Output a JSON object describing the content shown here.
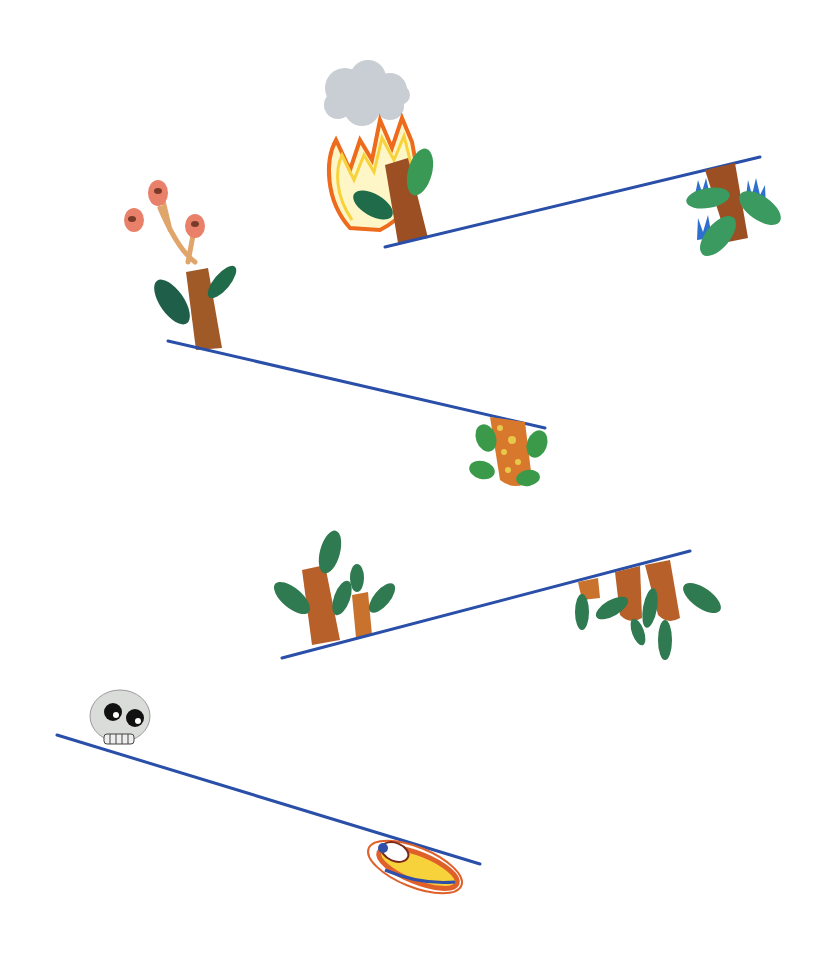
{
  "image": {
    "kind": "illustration",
    "description": "Four slanted blue ground lines; plants grow above and hang below each line; a burning tree with smoke cloud, a bud tree, a spotted cactus, small trees, a skull and a striped seed/cocoon.",
    "background": "#ffffff"
  },
  "colors": {
    "line": "#2a4fa8",
    "trunk": "#9c4f22",
    "trunk_light": "#c8722e",
    "leaf_dark": "#1f6b4a",
    "leaf": "#2f8a55",
    "leaf_light": "#4da86a",
    "flame_outer": "#ee6a1c",
    "flame_inner": "#f8d23a",
    "smoke": "#c7ccd2",
    "bud": "#e9806a",
    "bud_center": "#7a3a2a",
    "spot": "#e8c84a",
    "blue_flame": "#2f6fd0",
    "skull": "#d9dcd8",
    "eye": "#111111"
  },
  "scenes": [
    {
      "id": "line-1",
      "line": [
        385,
        247,
        760,
        157
      ],
      "above": "burning tree with smoke cloud",
      "below": "tree with blue flames"
    },
    {
      "id": "line-2",
      "line": [
        168,
        341,
        545,
        428
      ],
      "above": "tree with three buds",
      "below": "spotted cactus"
    },
    {
      "id": "line-3",
      "line": [
        282,
        658,
        690,
        551
      ],
      "above": "two small trees",
      "below": "hanging trunks with leaves"
    },
    {
      "id": "line-4",
      "line": [
        57,
        735,
        480,
        864
      ],
      "above": "skull",
      "below": "striped cocoon"
    }
  ]
}
